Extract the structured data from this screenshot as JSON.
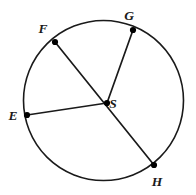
{
  "figure": {
    "name": "circle-with-radii",
    "background_color": "#ffffff",
    "stroke_color": "#1a1a1a",
    "point_color": "#000000",
    "stroke_width": 1.6,
    "point_radius": 3.1
  },
  "circle": {
    "center_x": 103.5,
    "center_y": 100.5,
    "radius": 80.0
  },
  "center_point": {
    "id": "S",
    "label": "S",
    "x": 107,
    "y": 103,
    "label_x": 113,
    "label_y": 108
  },
  "points": [
    {
      "id": "F",
      "label": "F",
      "x": 55,
      "y": 42,
      "label_x": 43,
      "label_y": 33
    },
    {
      "id": "G",
      "label": "G",
      "x": 133,
      "y": 30,
      "label_x": 129,
      "label_y": 20
    },
    {
      "id": "E",
      "label": "E",
      "x": 27,
      "y": 115,
      "label_x": 13,
      "label_y": 120
    },
    {
      "id": "H",
      "label": "H",
      "x": 154,
      "y": 165,
      "label_x": 157,
      "label_y": 186
    }
  ],
  "segments": [
    {
      "name": "chord-F-to-H-through-S",
      "from": "F",
      "to": "H",
      "x1": 55,
      "y1": 42,
      "x2": 154,
      "y2": 165
    },
    {
      "name": "radius-S-to-G",
      "from": "S",
      "to": "G",
      "x1": 107,
      "y1": 103,
      "x2": 133,
      "y2": 30
    },
    {
      "name": "radius-S-to-E",
      "from": "S",
      "to": "E",
      "x1": 107,
      "y1": 103,
      "x2": 27,
      "y2": 115
    }
  ]
}
